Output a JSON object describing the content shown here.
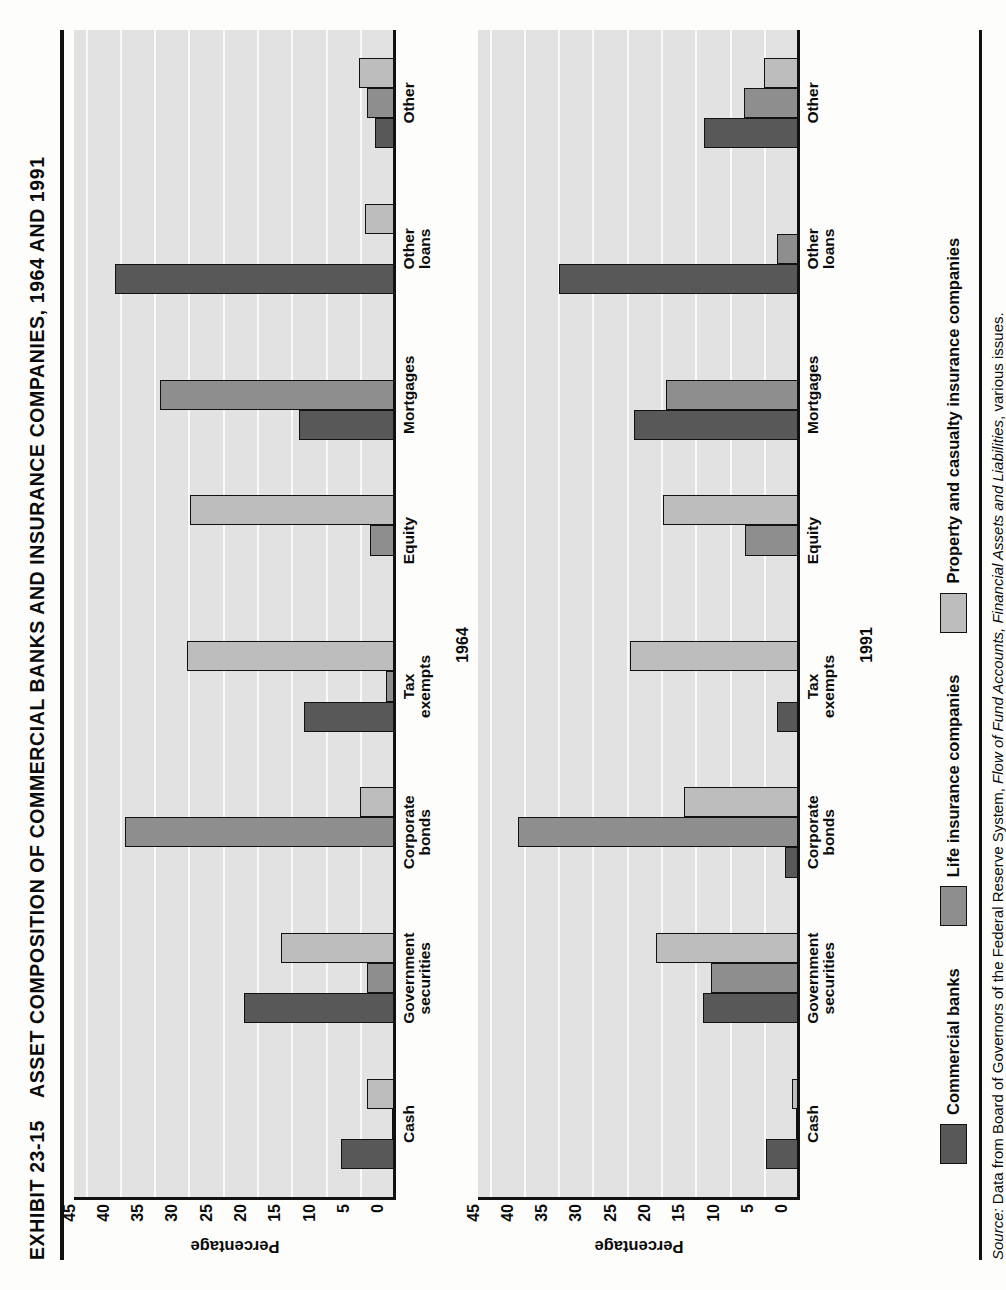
{
  "figure": {
    "exhibit_label": "EXHIBIT 23-15",
    "title": "ASSET COMPOSITION OF COMMERCIAL BANKS AND INSURANCE COMPANIES, 1964 AND 1991"
  },
  "source_note": {
    "lead": "Source:",
    "text_before_italic": " Data from Board of Governors of the Federal Reserve System, ",
    "italic_title": "Flow of Fund Accounts, Financial Assets and Liabilities",
    "text_after_italic": ", various issues."
  },
  "legend": {
    "items": [
      {
        "label": "Commercial banks",
        "color": "#585858"
      },
      {
        "label": "Life insurance companies",
        "color": "#8e8e8e"
      },
      {
        "label": "Property and casualty insurance companies",
        "color": "#bdbdbd"
      }
    ]
  },
  "chart_data": [
    {
      "type": "bar",
      "title": "1964",
      "xlabel": "",
      "ylabel": "Percentage",
      "ylim": [
        0,
        47
      ],
      "yticks": [
        0,
        5,
        10,
        15,
        20,
        25,
        30,
        35,
        40,
        45
      ],
      "grid": true,
      "legend_position": "bottom",
      "categories": [
        "Cash",
        "Government\nsecurities",
        "Corporate\nbonds",
        "Tax\nexempts",
        "Equity",
        "Mortgages",
        "Other\nloans",
        "Other"
      ],
      "series": [
        {
          "name": "Commercial banks",
          "color": "#585858",
          "values": [
            8.0,
            22.2,
            0.3,
            13.5,
            0.0,
            14.2,
            41.0,
            3.0
          ]
        },
        {
          "name": "Life insurance companies",
          "color": "#8e8e8e",
          "values": [
            0.6,
            4.2,
            39.5,
            1.5,
            3.8,
            34.5,
            0.0,
            4.2
          ]
        },
        {
          "name": "Property and casualty insurance companies",
          "color": "#bdbdbd",
          "values": [
            4.2,
            16.8,
            5.2,
            30.5,
            30.0,
            0.0,
            4.6,
            5.4
          ]
        }
      ]
    },
    {
      "type": "bar",
      "title": "1991",
      "xlabel": "",
      "ylabel": "Percentage",
      "ylim": [
        0,
        47
      ],
      "yticks": [
        0,
        5,
        10,
        15,
        20,
        25,
        30,
        35,
        40,
        45
      ],
      "grid": true,
      "legend_position": "bottom",
      "categories": [
        "Cash",
        "Government\nsecurities",
        "Corporate\nbonds",
        "Tax\nexempts",
        "Equity",
        "Mortgages",
        "Other\nloans",
        "Other"
      ],
      "series": [
        {
          "name": "Commercial banks",
          "color": "#585858",
          "values": [
            5.0,
            14.2,
            2.2,
            3.3,
            0.2,
            24.2,
            35.2,
            14.0
          ]
        },
        {
          "name": "Life insurance companies",
          "color": "#8e8e8e",
          "values": [
            0.6,
            13.0,
            41.2,
            0.0,
            8.0,
            19.5,
            3.3,
            8.2
          ]
        },
        {
          "name": "Property and casualty insurance companies",
          "color": "#bdbdbd",
          "values": [
            1.2,
            21.0,
            17.0,
            24.8,
            20.0,
            0.5,
            0.0,
            5.2
          ]
        }
      ]
    }
  ]
}
